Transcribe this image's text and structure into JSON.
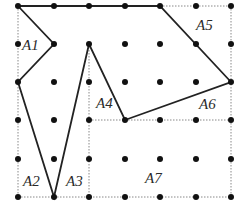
{
  "diagram": {
    "type": "geoboard-area-decomposition",
    "grid": {
      "columns": 7,
      "rows": 6,
      "x_positions": [
        18,
        54,
        89,
        125,
        160,
        196,
        231
      ],
      "y_positions": [
        6,
        44,
        82,
        120,
        159,
        197
      ],
      "dot_color": "#111111"
    },
    "polygon": {
      "vertices_grid": [
        [
          0,
          0
        ],
        [
          4,
          0
        ],
        [
          6,
          2
        ],
        [
          3,
          3
        ],
        [
          2,
          1
        ],
        [
          1,
          5
        ],
        [
          0,
          2
        ],
        [
          1,
          1
        ]
      ],
      "stroke_color": "#222222"
    },
    "dotted_lines_grid": [
      [
        [
          4,
          0
        ],
        [
          6,
          0
        ]
      ],
      [
        [
          6,
          0
        ],
        [
          6,
          5
        ]
      ],
      [
        [
          0,
          5
        ],
        [
          6,
          5
        ]
      ],
      [
        [
          0,
          0
        ],
        [
          0,
          5
        ]
      ],
      [
        [
          2,
          1
        ],
        [
          2,
          5
        ]
      ],
      [
        [
          2,
          3
        ],
        [
          6,
          3
        ]
      ]
    ],
    "dotted_color": "#888888",
    "labels": [
      {
        "text": "A1",
        "x": 22,
        "y": 50
      },
      {
        "text": "A5",
        "x": 196,
        "y": 30
      },
      {
        "text": "A4",
        "x": 96,
        "y": 108
      },
      {
        "text": "A6",
        "x": 199,
        "y": 109
      },
      {
        "text": "A2",
        "x": 23,
        "y": 186
      },
      {
        "text": "A3",
        "x": 66,
        "y": 186
      },
      {
        "text": "A7",
        "x": 145,
        "y": 183
      }
    ]
  }
}
